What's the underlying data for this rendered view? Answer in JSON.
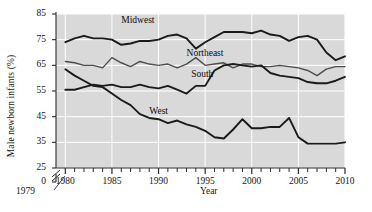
{
  "chart_data": {
    "type": "line",
    "title": "",
    "xlabel": "Year",
    "ylabel": "Male newborn infants (%)",
    "xlim": [
      1979,
      2010
    ],
    "ylim": [
      25,
      85
    ],
    "y_axis_break_at_zero": true,
    "grid": true,
    "grid_color": "#ffffff",
    "plot_background": "#d9d9d9",
    "legend_position": "inline-annotations",
    "x_major_ticks": [
      1980,
      1985,
      1990,
      1995,
      2000,
      2005,
      2010
    ],
    "x_minor_tick_interval": 1,
    "y_ticks": [
      0,
      25,
      35,
      45,
      55,
      65,
      75,
      85
    ],
    "x_start_label": "1979",
    "x": [
      1980,
      1981,
      1982,
      1983,
      1984,
      1985,
      1986,
      1987,
      1988,
      1989,
      1990,
      1991,
      1992,
      1993,
      1994,
      1995,
      1996,
      1997,
      1998,
      1999,
      2000,
      2001,
      2002,
      2003,
      2004,
      2005,
      2006,
      2007,
      2008,
      2009,
      2010
    ],
    "series": [
      {
        "name": "Midwest",
        "color": "#1a1a1a",
        "width": 1.9,
        "label_x": 1986.0,
        "label_y": 82.0,
        "values": [
          74.0,
          75.5,
          76.5,
          75.5,
          75.5,
          75.0,
          73.0,
          73.5,
          74.5,
          74.5,
          75.0,
          76.5,
          77.0,
          75.5,
          71.5,
          74.0,
          76.0,
          78.0,
          78.0,
          78.0,
          77.5,
          78.5,
          77.0,
          76.5,
          74.5,
          76.0,
          76.5,
          75.0,
          70.0,
          67.0,
          68.5
        ]
      },
      {
        "name": "Northeast",
        "color": "#4d4d4d",
        "width": 1.4,
        "label_x": 1993.0,
        "label_y": 69.0,
        "values": [
          66.5,
          66.0,
          65.0,
          65.0,
          64.0,
          68.0,
          66.0,
          64.5,
          66.5,
          65.5,
          65.0,
          65.5,
          64.0,
          65.5,
          68.0,
          65.0,
          65.5,
          66.0,
          64.0,
          65.5,
          65.5,
          64.5,
          64.5,
          65.0,
          64.5,
          64.0,
          63.0,
          61.0,
          63.5,
          64.5,
          64.5
        ]
      },
      {
        "name": "South",
        "color": "#1a1a1a",
        "width": 1.9,
        "label_x": 1993.5,
        "label_y": 61.0,
        "values": [
          55.5,
          55.5,
          56.5,
          57.5,
          57.0,
          57.5,
          56.5,
          56.5,
          57.5,
          56.5,
          56.0,
          57.0,
          55.5,
          54.0,
          57.0,
          57.0,
          63.0,
          65.0,
          65.5,
          65.0,
          64.5,
          65.0,
          62.0,
          61.0,
          60.5,
          60.0,
          58.5,
          58.0,
          58.0,
          59.0,
          60.5
        ]
      },
      {
        "name": "West",
        "color": "#1a1a1a",
        "width": 1.9,
        "label_x": 1989.0,
        "label_y": 46.5,
        "values": [
          63.5,
          61.0,
          59.0,
          57.0,
          56.5,
          54.0,
          51.5,
          49.5,
          46.0,
          44.5,
          44.0,
          42.5,
          43.5,
          42.0,
          41.0,
          39.5,
          37.0,
          36.5,
          40.0,
          44.0,
          40.5,
          40.5,
          41.0,
          41.0,
          44.5,
          37.0,
          34.5,
          34.5,
          34.5,
          34.5,
          35.0
        ]
      }
    ]
  }
}
